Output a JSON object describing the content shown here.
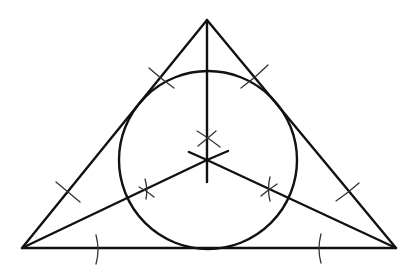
{
  "diagram": {
    "stroke_color": "#111111",
    "arc_color": "#333333",
    "background": "#ffffff",
    "elements": [
      "triangle",
      "incircle",
      "angle-bisector-top",
      "angle-bisector-left",
      "angle-bisector-right",
      "construction-arcs"
    ],
    "labels": []
  }
}
